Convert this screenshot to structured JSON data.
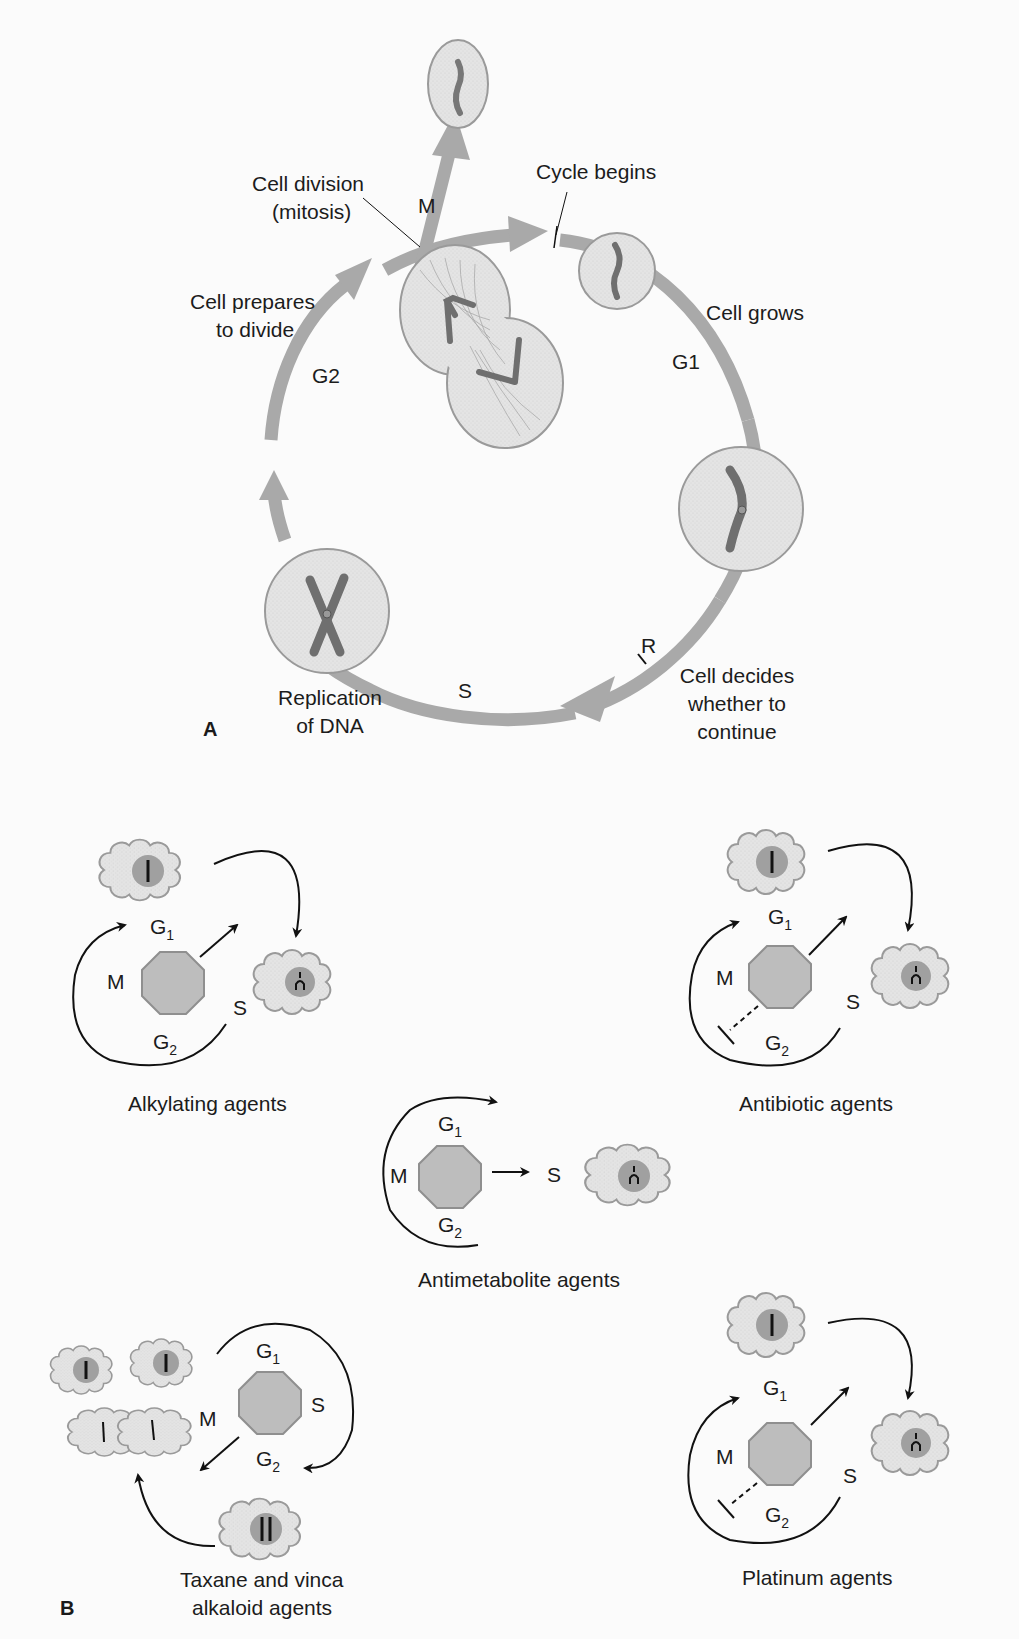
{
  "colors": {
    "arrow_gray": "#a9a9a9",
    "cell_fill": "#e6e6e6",
    "cell_stroke": "#9a9a9a",
    "chromosome": "#7a7a7a",
    "octagon_fill": "#bdbdbd",
    "nucleus": "#a0a0a0",
    "ink": "#1a1a1a"
  },
  "panel_a": {
    "label": "A",
    "labels": {
      "cycle_begins": "Cycle begins",
      "cell_division_1": "Cell division",
      "cell_division_2": "(mitosis)",
      "m": "M",
      "cell_prepares_1": "Cell prepares",
      "cell_prepares_2": "to divide",
      "g2": "G2",
      "cell_grows": "Cell grows",
      "g1": "G1",
      "r": "R",
      "cell_decides_1": "Cell decides",
      "cell_decides_2": "whether to",
      "cell_decides_3": "continue",
      "s": "S",
      "replication_1": "Replication",
      "replication_2": "of DNA"
    }
  },
  "panel_b": {
    "label": "B",
    "phase": {
      "g": "G",
      "sub1": "1",
      "sub2": "2",
      "m": "M",
      "s": "S"
    },
    "agents": [
      {
        "name": "Alkylating agents"
      },
      {
        "name": "Antibiotic agents"
      },
      {
        "name": "Antimetabolite agents"
      },
      {
        "name_1": "Taxane and vinca",
        "name_2": "alkaloid agents"
      },
      {
        "name": "Platinum agents"
      }
    ]
  }
}
